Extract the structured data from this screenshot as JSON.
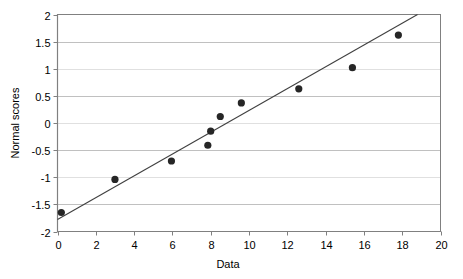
{
  "chart_data": {
    "type": "scatter",
    "title": "",
    "xlabel": "Data",
    "ylabel": "Normal scores",
    "xlim": [
      0,
      20
    ],
    "ylim": [
      -2,
      2
    ],
    "xticks": [
      0,
      2,
      4,
      6,
      8,
      10,
      12,
      14,
      16,
      18,
      20
    ],
    "xtick_labels": [
      "0",
      "2",
      "4",
      "6",
      "8",
      "10",
      "12",
      "14",
      "16",
      "18",
      "20"
    ],
    "yticks": [
      -2,
      -1.5,
      -1,
      -0.5,
      0,
      0.5,
      1,
      1.5,
      2
    ],
    "ytick_labels": [
      "-2",
      "-1.5",
      "-1",
      "-0.5",
      "0",
      "0.5",
      "1",
      "1.5",
      "2"
    ],
    "grid": "horizontal",
    "legend": "none",
    "marker": "filled-circle",
    "marker_color": "#262626",
    "line_color": "#404040",
    "grid_color": "#c0c0c0",
    "axis_color": "#808080",
    "series": [
      {
        "name": "Normal scores vs Data",
        "points": [
          {
            "x": 0.2,
            "y": -1.65
          },
          {
            "x": 3.0,
            "y": -1.04
          },
          {
            "x": 5.95,
            "y": -0.7
          },
          {
            "x": 7.85,
            "y": -0.41
          },
          {
            "x": 8.0,
            "y": -0.15
          },
          {
            "x": 8.5,
            "y": 0.12
          },
          {
            "x": 9.6,
            "y": 0.37
          },
          {
            "x": 12.6,
            "y": 0.63
          },
          {
            "x": 15.4,
            "y": 1.02
          },
          {
            "x": 17.8,
            "y": 1.62
          }
        ]
      }
    ],
    "trendline": {
      "name": "fitted line",
      "x0": 0.0,
      "y0": -1.78,
      "x1": 18.8,
      "y1": 2.0
    }
  }
}
